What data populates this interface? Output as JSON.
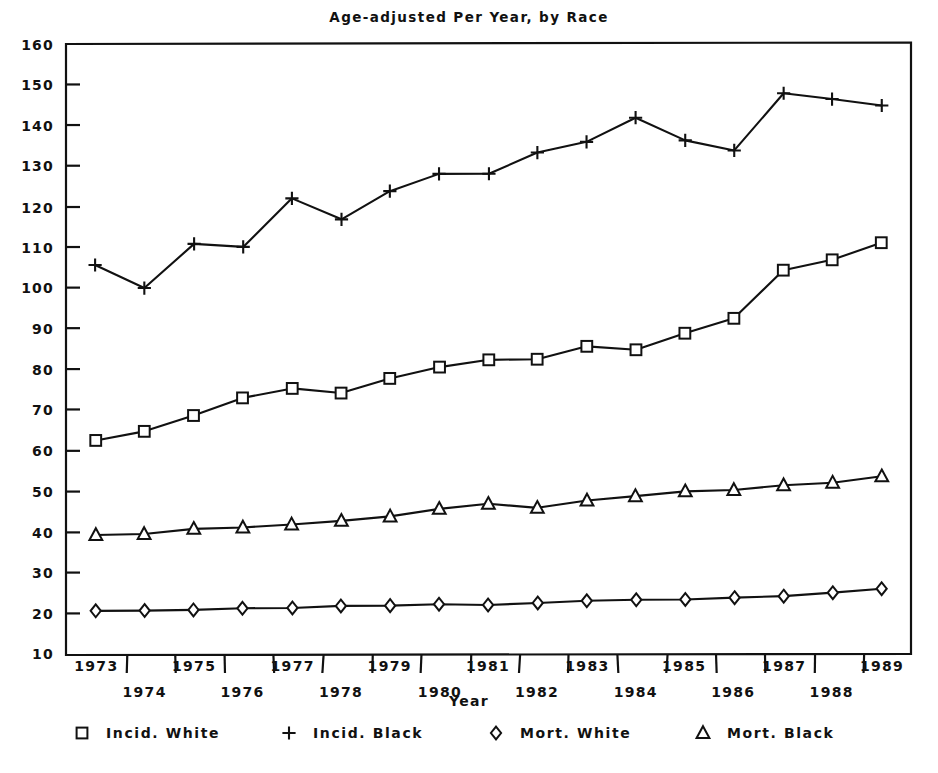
{
  "chart_data": {
    "type": "line",
    "title": "Age-adjusted Per Year, by Race",
    "xlabel": "Year",
    "ylabel": "",
    "grid": false,
    "legend_position": "bottom",
    "xlim": [
      1972.4,
      1989.6
    ],
    "ylim": [
      10,
      160
    ],
    "ytick_step": 10,
    "yticks": [
      10,
      20,
      30,
      40,
      50,
      60,
      70,
      80,
      90,
      100,
      110,
      120,
      130,
      140,
      150,
      160
    ],
    "categories": [
      1973,
      1974,
      1975,
      1976,
      1977,
      1978,
      1979,
      1980,
      1981,
      1982,
      1983,
      1984,
      1985,
      1986,
      1987,
      1988,
      1989
    ],
    "xticklabels": [
      "1973",
      "1974",
      "1975",
      "1976",
      "1977",
      "1978",
      "1979",
      "1980",
      "1981",
      "1982",
      "1983",
      "1984",
      "1985",
      "1986",
      "1987",
      "1988",
      "1989"
    ],
    "series": [
      {
        "name": "Incid. White",
        "marker": "square",
        "values": [
          62.5,
          64.8,
          68.8,
          73.0,
          75.2,
          74.3,
          77.8,
          80.5,
          82.2,
          82.4,
          85.5,
          84.7,
          88.8,
          92.6,
          104.5,
          107.0,
          111.0
        ]
      },
      {
        "name": "Incid. Black",
        "marker": "plus",
        "values": [
          105.5,
          100.0,
          111.0,
          110.0,
          122.2,
          117.0,
          123.8,
          128.0,
          128.0,
          133.2,
          136.0,
          142.0,
          136.3,
          133.8,
          148.0,
          146.5,
          144.8
        ]
      },
      {
        "name": "Mort. White",
        "marker": "diamond",
        "values": [
          20.6,
          20.7,
          20.7,
          21.3,
          21.4,
          21.7,
          22.0,
          22.4,
          22.2,
          22.5,
          23.1,
          23.3,
          23.4,
          24.0,
          24.3,
          25.1,
          26.0
        ]
      },
      {
        "name": "Mort. Black",
        "marker": "triangle",
        "values": [
          39.1,
          39.5,
          40.8,
          41.1,
          41.8,
          42.7,
          43.8,
          45.8,
          46.9,
          46.1,
          47.9,
          48.8,
          49.9,
          50.5,
          51.5,
          52.2,
          53.7
        ]
      }
    ]
  },
  "legend": {
    "items": [
      {
        "marker": "square",
        "label": "Incid. White"
      },
      {
        "marker": "plus",
        "label": "Incid. Black"
      },
      {
        "marker": "diamond",
        "label": "Mort. White"
      },
      {
        "marker": "triangle",
        "label": "Mort. Black"
      }
    ]
  },
  "colors": {
    "ink": "#111111",
    "background": "#ffffff",
    "marker_fill": "#ffffff"
  }
}
